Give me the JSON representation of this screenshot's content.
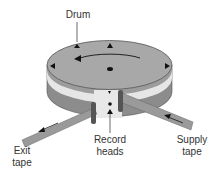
{
  "diagram": {
    "type": "helical-scan drum illustration",
    "labels": {
      "drum": "Drum",
      "exit_tape_line1": "Exit",
      "exit_tape_line2": "tape",
      "record_heads_line1": "Record",
      "record_heads_line2": "heads",
      "supply_tape_line1": "Supply",
      "supply_tape_line2": "tape"
    },
    "colors": {
      "drum_top": "#a8a8a8",
      "drum_band_light": "#e6e6e6",
      "drum_band_dark": "#8c8c8c",
      "tape": "#9a9a9a",
      "outline": "#555555",
      "marker": "#111111",
      "text": "#333333"
    }
  }
}
